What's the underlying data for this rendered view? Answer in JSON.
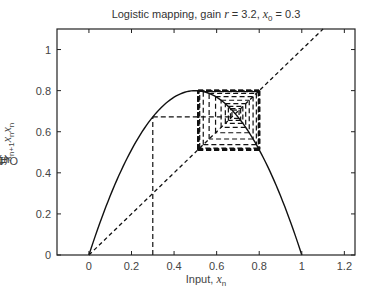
{
  "chart_data": {
    "type": "line",
    "title": "Logistic mapping, gain r = 3.2, x0 = 0.3",
    "title_parts": {
      "prefix": "Logistic mapping, gain ",
      "r_symbol": "r",
      "r_eq": " = 3.2, ",
      "x_symbol": "x",
      "x_sub": "0",
      "x_eq": " = 0.3"
    },
    "xlabel": "Input, x_n",
    "xlabel_parts": {
      "text": "Input, ",
      "symbol": "x",
      "sub": "n"
    },
    "ylabel": "Output, x_{n+1} = r x_n (1 − x_n)",
    "ylabel_parts": {
      "text": "Output, ",
      "symbol": "x",
      "sub": "n+1",
      "eq": " = r",
      "sym2": "x",
      "sub2": "n",
      "rest": "(1−",
      "sym3": "x",
      "sub3": "n",
      "close": ")"
    },
    "xlim": [
      -0.15,
      1.25
    ],
    "ylim": [
      0,
      1.1
    ],
    "xticks": [
      0,
      0.2,
      0.4,
      0.6,
      0.8,
      1,
      1.2
    ],
    "xtick_labels": [
      "0",
      "0.2",
      "0.4",
      "0.6",
      "0.8",
      "1",
      "1.2"
    ],
    "yticks": [
      0,
      0.2,
      0.4,
      0.6,
      0.8,
      1
    ],
    "ytick_labels": [
      "0",
      "0.2",
      "0.4",
      "0.6",
      "0.8",
      "1"
    ],
    "grid": false,
    "legend": null,
    "parameters": {
      "r": 3.2,
      "x0": 0.3,
      "iterations": 30
    },
    "series": [
      {
        "name": "logistic map f(x) = 3.2 x (1 − x)",
        "style": "solid",
        "x": [
          0,
          0.1,
          0.2,
          0.3,
          0.4,
          0.5,
          0.6,
          0.7,
          0.8,
          0.9,
          1.0
        ],
        "y": [
          0,
          0.288,
          0.512,
          0.672,
          0.768,
          0.8,
          0.768,
          0.672,
          0.512,
          0.288,
          0
        ]
      },
      {
        "name": "identity line y = x",
        "style": "dashed",
        "x": [
          0,
          1.1
        ],
        "y": [
          0,
          1.1
        ]
      },
      {
        "name": "cobweb iteration",
        "style": "dashed",
        "x": [
          0.3,
          0.3,
          0.672,
          0.672,
          0.7054,
          0.7054,
          0.6651,
          0.6651,
          0.7124,
          0.7124,
          0.513,
          0.7995
        ],
        "y": [
          0,
          0.672,
          0.672,
          0.7054,
          0.7054,
          0.6651,
          0.6651,
          0.7124,
          0.7124,
          0.6554,
          0.7995,
          0.513
        ]
      }
    ],
    "annotations": [
      "Cobweb converges to period-2 cycle ≈ {0.513, 0.799}"
    ]
  }
}
